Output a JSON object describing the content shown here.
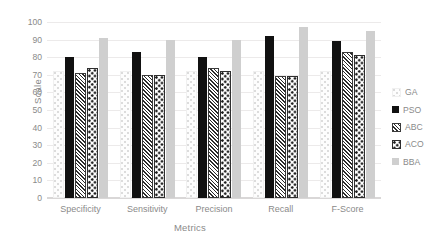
{
  "chart_data": {
    "type": "bar",
    "title": "",
    "xlabel": "Metrics",
    "ylabel": "Scale",
    "ylim": [
      0,
      100
    ],
    "ytick_step": 10,
    "yticks": [
      0,
      10,
      20,
      30,
      40,
      50,
      60,
      70,
      80,
      90,
      100
    ],
    "grid": true,
    "grid_axis": "y",
    "legend_position": "right",
    "categories": [
      "Specificity",
      "Sensitivity",
      "Precision",
      "Recall",
      "F-Score"
    ],
    "series": [
      {
        "name": "GA",
        "pattern": "light-dotted",
        "color": "#fdfdfd",
        "values": [
          71,
          71,
          71,
          71,
          71
        ]
      },
      {
        "name": "PSO",
        "pattern": "solid-black",
        "color": "#111111",
        "values": [
          80,
          83,
          80,
          92,
          89
        ]
      },
      {
        "name": "ABC",
        "pattern": "diagonal-hatch",
        "color": "#2b2b2b",
        "values": [
          70,
          69,
          73,
          68,
          82
        ]
      },
      {
        "name": "ACO",
        "pattern": "checkered-dots",
        "color": "#1a1a1a",
        "values": [
          73,
          69,
          71,
          68,
          80
        ]
      },
      {
        "name": "BBA",
        "pattern": "solid-lightgray",
        "color": "#cfcfcf",
        "values": [
          91,
          90,
          90,
          97,
          95
        ]
      }
    ]
  }
}
